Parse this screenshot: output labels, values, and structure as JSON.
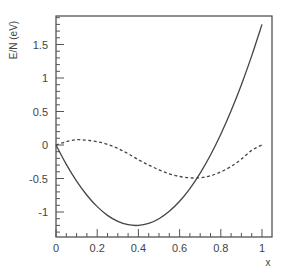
{
  "chart_data": {
    "type": "line",
    "title": "",
    "xlabel": "x",
    "ylabel": "E/N (eV)",
    "xlim": [
      0,
      1.04
    ],
    "ylim": [
      -1.35,
      1.92
    ],
    "grid": false,
    "legend": null,
    "x_ticks": [
      0,
      0.2,
      0.4,
      0.6,
      0.8,
      1
    ],
    "x_tick_labels": [
      "0",
      "0.2",
      "0.4",
      "0.6",
      "0.8",
      "1"
    ],
    "y_ticks": [
      -1,
      -0.5,
      0,
      0.5,
      1,
      1.5
    ],
    "y_tick_labels": [
      "-1",
      "-0.5",
      "0",
      "0.5",
      "1",
      "1.5"
    ],
    "x": [
      0,
      0.05,
      0.1,
      0.15,
      0.2,
      0.25,
      0.3,
      0.35,
      0.4,
      0.45,
      0.5,
      0.55,
      0.6,
      0.65,
      0.7,
      0.75,
      0.8,
      0.85,
      0.9,
      0.95,
      1.0
    ],
    "series": [
      {
        "name": "solid",
        "style": "solid",
        "values": [
          0.0,
          -0.29,
          -0.54,
          -0.75,
          -0.92,
          -1.05,
          -1.14,
          -1.19,
          -1.2,
          -1.17,
          -1.1,
          -0.99,
          -0.84,
          -0.65,
          -0.42,
          -0.15,
          0.16,
          0.51,
          0.9,
          1.33,
          1.8
        ]
      },
      {
        "name": "dashed",
        "style": "dashed",
        "values": [
          0.0,
          0.05,
          0.08,
          0.07,
          0.05,
          0.01,
          -0.05,
          -0.13,
          -0.22,
          -0.3,
          -0.37,
          -0.43,
          -0.47,
          -0.49,
          -0.49,
          -0.46,
          -0.4,
          -0.32,
          -0.21,
          -0.08,
          0.0
        ]
      }
    ]
  }
}
